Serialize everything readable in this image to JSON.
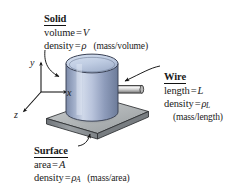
{
  "figure": {
    "background_color": "#ffffff",
    "text_color": "#1a1a1a"
  },
  "axes": {
    "x_label": "x",
    "y_label": "y",
    "z_label": "z"
  },
  "labels": {
    "solid": {
      "heading": "Solid",
      "line1_name": "volume",
      "line1_eq": "=",
      "line1_value": "V",
      "line2_name": "density",
      "line2_eq": "=",
      "line2_value": "ρ",
      "units": "(mass/volume)"
    },
    "wire": {
      "heading": "Wire",
      "line1_name": "length",
      "line1_eq": "=",
      "line1_value": "L",
      "line2_name": "density",
      "line2_eq": "=",
      "line2_value": "ρ",
      "line2_subscript": "L",
      "units": "(mass/length)"
    },
    "surface": {
      "heading": "Surface",
      "line1_name": "area",
      "line1_eq": "=",
      "line1_value": "A",
      "line2_name": "density",
      "line2_eq": "=",
      "line2_value": "ρ",
      "line2_subscript": "A",
      "units": "(mass/area)"
    }
  },
  "objects": {
    "cylinder": {
      "name": "solid-cylinder",
      "fill_light": "#ccd6ea",
      "fill_mid": "#98a8c6",
      "fill_dark": "#6f7e9d",
      "top_face": "#c3d0e6",
      "outline": "#3a4154"
    },
    "wire_rod": {
      "name": "wire-rod",
      "fill_light": "#e3e3e3",
      "fill_mid": "#b4b4b4",
      "fill_dark": "#7c7c7c",
      "outline": "#2e2e2e"
    },
    "plate": {
      "name": "surface-plate",
      "top_face": "#b9bcbd",
      "front_face": "#8d9092",
      "side_face": "#6f7376",
      "outline": "#2e2e2e"
    }
  },
  "leaders": {
    "solid_leader": "curved-arrow-to-cylinder",
    "wire_leader": "curved-arrow-to-wire",
    "surface_leader": "curved-arrow-to-plate"
  }
}
